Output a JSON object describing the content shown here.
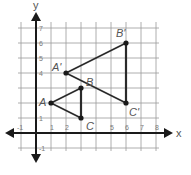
{
  "diagram": {
    "type": "coordinate-plane-dilation",
    "axes": {
      "x_label": "x",
      "y_label": "y",
      "x_ticks": [
        {
          "value": -1,
          "label": "-1"
        },
        {
          "value": 1,
          "label": "1"
        },
        {
          "value": 2,
          "label": "2"
        },
        {
          "value": 5,
          "label": "5"
        },
        {
          "value": 6,
          "label": "6"
        },
        {
          "value": 7,
          "label": "7"
        },
        {
          "value": 8,
          "label": "8"
        }
      ],
      "y_ticks": [
        {
          "value": -1,
          "label": "-1"
        },
        {
          "value": 1,
          "label": "1"
        },
        {
          "value": 4,
          "label": "4"
        },
        {
          "value": 5,
          "label": "5"
        },
        {
          "value": 6,
          "label": "6"
        },
        {
          "value": 7,
          "label": "7"
        }
      ],
      "grid_x_range": [
        -1,
        8
      ],
      "grid_y_range": [
        -1,
        7
      ]
    },
    "triangles": [
      {
        "name": "ABC",
        "vertices": [
          {
            "label": "A",
            "x": 1,
            "y": 2
          },
          {
            "label": "B",
            "x": 3,
            "y": 3
          },
          {
            "label": "C",
            "x": 3,
            "y": 1
          }
        ]
      },
      {
        "name": "A'B'C'",
        "vertices": [
          {
            "label": "A'",
            "x": 2,
            "y": 4
          },
          {
            "label": "B'",
            "x": 6,
            "y": 6
          },
          {
            "label": "C'",
            "x": 6,
            "y": 2
          }
        ]
      }
    ],
    "colors": {
      "grid": "#9a9a9a",
      "axis": "#1a1a1a",
      "edge": "#2a2a2a",
      "label": "#555555"
    }
  }
}
